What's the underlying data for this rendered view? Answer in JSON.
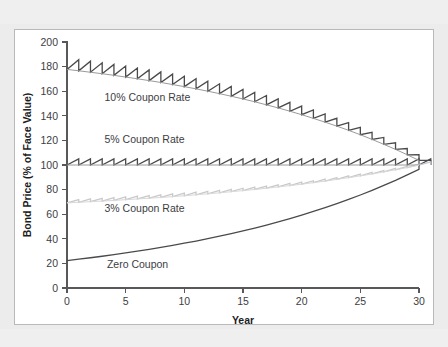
{
  "figure": {
    "background_color": "#ffffff",
    "frame_color": "#b9b9b9",
    "page_color": "#ececec"
  },
  "chart_data": {
    "type": "line",
    "title": "",
    "xlabel": "Year",
    "ylabel": "Bond Price (% of Face Value)",
    "xlim": [
      0,
      30
    ],
    "ylim": [
      0,
      200
    ],
    "xticks": [
      0,
      5,
      10,
      15,
      20,
      25,
      30
    ],
    "yticks": [
      0,
      20,
      40,
      60,
      80,
      100,
      120,
      140,
      160,
      180,
      200
    ],
    "xtick_labels": [
      "0",
      "5",
      "10",
      "15",
      "20",
      "25",
      "30"
    ],
    "ytick_labels": [
      "0",
      "20",
      "40",
      "60",
      "80",
      "100",
      "120",
      "140",
      "160",
      "180",
      "200"
    ],
    "grid": false,
    "legend_position": "inline-annotations",
    "market_yield_pct": 5,
    "maturity_years": 30,
    "par_value_pct": 100,
    "note": "Bond prices converge (pull to par) to 100% of face value at maturity; sawtooth teeth are accrued-interest build-up and drop at each annual coupon payment.",
    "series": [
      {
        "name": "10% Coupon Rate",
        "coupon_rate_pct": 10,
        "color": "#4a4a4c",
        "line_width": 1.3,
        "sawtooth": true,
        "label": "10% Coupon Rate",
        "label_x_year": 3.2,
        "label_y_value": 152,
        "start_value": 177.7,
        "end_value": 100,
        "clean_values": [
          177.7,
          176.6,
          175.4,
          174.2,
          172.9,
          171.5,
          170.1,
          168.6,
          167.1,
          165.4,
          163.7,
          161.9,
          160.0,
          158.0,
          155.9,
          153.7,
          151.4,
          148.9,
          146.4,
          143.7,
          140.9,
          137.9,
          134.8,
          131.6,
          128.2,
          124.6,
          120.8,
          116.8,
          112.7,
          108.3,
          103.7,
          100.0
        ],
        "peak_values": [
          185.6,
          184.4,
          183.1,
          181.8,
          180.4,
          178.9,
          177.3,
          175.7,
          173.9,
          172.1,
          170.2,
          168.2,
          166.0,
          163.8,
          161.5,
          159.0,
          156.5,
          153.8,
          150.9,
          147.9,
          144.8,
          141.5,
          138.0,
          134.4,
          130.6,
          126.6,
          122.4,
          118.0,
          113.4,
          108.5,
          103.7
        ]
      },
      {
        "name": "5% Coupon Rate",
        "coupon_rate_pct": 5,
        "color": "#4a4a4c",
        "line_width": 1.3,
        "sawtooth": true,
        "label": "5% Coupon Rate",
        "label_x_year": 3.2,
        "label_y_value": 118,
        "start_value": 100,
        "end_value": 100,
        "clean_values": [
          100,
          100,
          100,
          100,
          100,
          100,
          100,
          100,
          100,
          100,
          100,
          100,
          100,
          100,
          100,
          100,
          100,
          100,
          100,
          100,
          100,
          100,
          100,
          100,
          100,
          100,
          100,
          100,
          100,
          100,
          100,
          100
        ],
        "peak_values": [
          105,
          105,
          105,
          105,
          105,
          105,
          105,
          105,
          105,
          105,
          105,
          105,
          105,
          105,
          105,
          105,
          105,
          105,
          105,
          105,
          105,
          105,
          105,
          105,
          105,
          105,
          105,
          105,
          105,
          105,
          105
        ]
      },
      {
        "name": "3% Coupon Rate",
        "coupon_rate_pct": 3,
        "color": "#c9c9cb",
        "line_width": 1.3,
        "sawtooth": true,
        "label": "3% Coupon Rate",
        "label_x_year": 3.2,
        "label_y_value": 62,
        "start_value": 69.2,
        "end_value": 100,
        "clean_values": [
          69.2,
          69.7,
          70.2,
          70.7,
          71.2,
          71.8,
          72.4,
          73.0,
          73.6,
          74.3,
          75.0,
          75.8,
          76.6,
          77.4,
          78.3,
          79.2,
          80.1,
          81.1,
          82.2,
          83.3,
          84.4,
          85.7,
          86.9,
          88.3,
          89.7,
          91.2,
          92.7,
          94.4,
          96.1,
          97.9,
          99.8,
          100.0
        ],
        "peak_values": [
          71.9,
          72.4,
          72.9,
          73.5,
          74.0,
          74.6,
          75.2,
          75.8,
          76.5,
          77.2,
          77.9,
          78.6,
          79.4,
          80.2,
          81.1,
          82.0,
          82.9,
          83.9,
          85.0,
          86.1,
          87.2,
          88.5,
          89.7,
          91.1,
          92.5,
          94.0,
          95.5,
          97.2,
          98.9,
          100.7,
          102.6
        ]
      },
      {
        "name": "Zero Coupon",
        "coupon_rate_pct": 0,
        "color": "#4a4a4c",
        "line_width": 1.3,
        "sawtooth": false,
        "label": "Zero Coupon",
        "label_x_year": 3.4,
        "label_y_value": 16,
        "start_value": 22.3,
        "end_value": 100,
        "clean_values": [
          22.3,
          23.4,
          24.6,
          25.8,
          27.1,
          28.5,
          29.9,
          31.4,
          33.0,
          34.6,
          36.4,
          38.2,
          40.1,
          42.1,
          44.2,
          46.4,
          48.7,
          51.2,
          53.7,
          56.4,
          59.2,
          62.2,
          65.3,
          68.6,
          72.0,
          75.6,
          79.4,
          83.4,
          87.5,
          91.9,
          96.5,
          100.0
        ]
      }
    ]
  }
}
